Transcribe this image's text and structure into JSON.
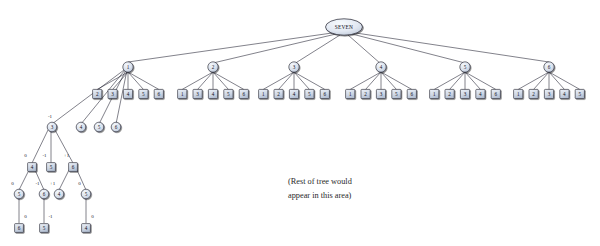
{
  "figure": {
    "root": {
      "label": "SEVEN",
      "shape": "ellipse"
    },
    "annotation": {
      "line1": "(Rest of tree would",
      "line2": "appear in this area)"
    },
    "colors": {
      "node_fill_light": "#e8ecf3",
      "node_fill_mid": "#c9d2e0",
      "node_stroke": "#20202c",
      "edge": "#1a1a2b",
      "text": "#10101a",
      "background": "#ffffff"
    }
  },
  "chart_data": {
    "type": "diagram",
    "level1_circles": [
      "1",
      "2",
      "3",
      "4",
      "5",
      "6"
    ],
    "level2_squares": [
      {
        "parent": "1",
        "children": [
          "2",
          "3",
          "4",
          "5",
          "6"
        ]
      },
      {
        "parent": "2",
        "children": [
          "1",
          "3",
          "4",
          "5",
          "6"
        ]
      },
      {
        "parent": "3",
        "children": [
          "1",
          "2",
          "4",
          "5",
          "6"
        ]
      },
      {
        "parent": "4",
        "children": [
          "1",
          "2",
          "3",
          "5",
          "6"
        ]
      },
      {
        "parent": "5",
        "children": [
          "1",
          "2",
          "3",
          "4",
          "6"
        ]
      },
      {
        "parent": "6",
        "children": [
          "1",
          "2",
          "3",
          "4",
          "5"
        ]
      }
    ],
    "expanded_branch": {
      "from_square": "2",
      "level3_circles": [
        "3",
        "4",
        "5",
        "6"
      ],
      "circle3_value": "-1",
      "level4_squares": [
        {
          "label": "4",
          "edge": "0"
        },
        {
          "label": "5",
          "edge": "-1"
        },
        {
          "label": "6",
          "edge": "+1"
        }
      ],
      "level5_circles": [
        {
          "label": "5",
          "edge": "0",
          "parent": "4"
        },
        {
          "label": "6",
          "edge": "-1",
          "parent": "4"
        },
        {
          "label": "4",
          "edge": "+1",
          "parent": "6"
        },
        {
          "label": "5",
          "edge": "0",
          "parent": "6"
        }
      ],
      "level6_squares": [
        {
          "label": "6",
          "edge": "0",
          "parent": "5"
        },
        {
          "label": "5",
          "edge": "-1",
          "parent": "6"
        },
        {
          "label": "4",
          "edge": "0",
          "parent": "5"
        }
      ]
    }
  }
}
